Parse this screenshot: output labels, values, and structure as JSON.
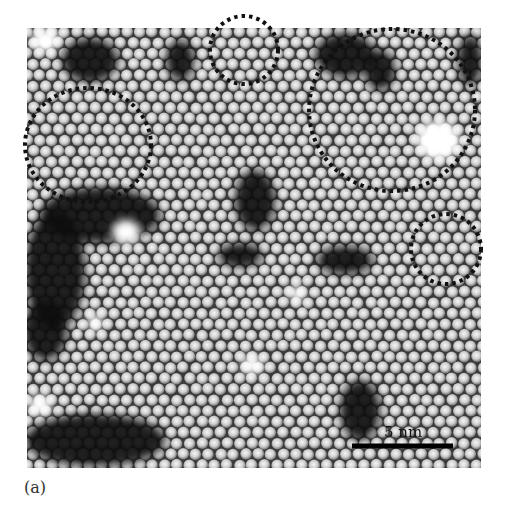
{
  "figure": {
    "panel_label": "(a)",
    "image_bounds": {
      "x": 27,
      "y": 28,
      "width": 454,
      "height": 440
    },
    "sphere_spacing_px": 12.5,
    "colors": {
      "background": "#ffffff",
      "substrate_dark": "#0a0a0a",
      "sphere_light": "#f2f2f2",
      "sphere_mid": "#9a9a9a",
      "circle_stroke": "#111111",
      "scalebar": "#000000"
    },
    "scale_bar": {
      "label": "5 nm",
      "x1": 352,
      "x2": 453,
      "y": 446,
      "label_x": 384,
      "label_y": 425
    },
    "highlight_circles": [
      {
        "name": "top-center",
        "cx": 244,
        "cy": 50,
        "rx": 34,
        "ry": 34
      },
      {
        "name": "top-right-large",
        "cx": 392,
        "cy": 110,
        "rx": 83,
        "ry": 81
      },
      {
        "name": "left",
        "cx": 88,
        "cy": 145,
        "rx": 63,
        "ry": 57
      },
      {
        "name": "right-small",
        "cx": 446,
        "cy": 249,
        "rx": 35,
        "ry": 35
      }
    ],
    "dark_regions": [
      {
        "cx": 90,
        "cy": 60,
        "rx": 28,
        "ry": 22
      },
      {
        "cx": 180,
        "cy": 60,
        "rx": 14,
        "ry": 20
      },
      {
        "cx": 345,
        "cy": 55,
        "rx": 30,
        "ry": 22
      },
      {
        "cx": 380,
        "cy": 70,
        "rx": 15,
        "ry": 20
      },
      {
        "cx": 100,
        "cy": 215,
        "rx": 60,
        "ry": 28
      },
      {
        "cx": 55,
        "cy": 270,
        "rx": 30,
        "ry": 60
      },
      {
        "cx": 45,
        "cy": 330,
        "rx": 22,
        "ry": 30
      },
      {
        "cx": 255,
        "cy": 200,
        "rx": 20,
        "ry": 30
      },
      {
        "cx": 345,
        "cy": 260,
        "rx": 28,
        "ry": 14
      },
      {
        "cx": 95,
        "cy": 440,
        "rx": 70,
        "ry": 26
      },
      {
        "cx": 360,
        "cy": 410,
        "rx": 20,
        "ry": 30
      },
      {
        "cx": 470,
        "cy": 60,
        "rx": 12,
        "ry": 25
      },
      {
        "cx": 240,
        "cy": 255,
        "rx": 22,
        "ry": 12
      }
    ],
    "bright_blobs": [
      {
        "cx": 438,
        "cy": 140,
        "rx": 22,
        "ry": 20
      },
      {
        "cx": 126,
        "cy": 232,
        "rx": 14,
        "ry": 12
      },
      {
        "cx": 252,
        "cy": 365,
        "rx": 10,
        "ry": 10
      },
      {
        "cx": 297,
        "cy": 294,
        "rx": 8,
        "ry": 8
      },
      {
        "cx": 95,
        "cy": 322,
        "rx": 8,
        "ry": 8
      },
      {
        "cx": 40,
        "cy": 405,
        "rx": 12,
        "ry": 10
      },
      {
        "cx": 45,
        "cy": 40,
        "rx": 14,
        "ry": 12
      }
    ]
  }
}
